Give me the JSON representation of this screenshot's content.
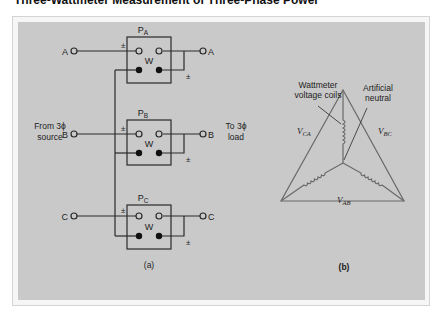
{
  "title": "Three-Wattmeter Measurement of Three-Phase Power",
  "panel_a": {
    "caption": "(a)",
    "source_label_line1": "From 3ϕ",
    "source_label_line2": "source",
    "load_label_line1": "To 3ϕ",
    "load_label_line2": "load",
    "wattmeters": [
      {
        "name": "P",
        "sub": "A",
        "phase": "A",
        "meter": "W",
        "pm": "±"
      },
      {
        "name": "P",
        "sub": "B",
        "phase": "B",
        "meter": "W",
        "pm": "±"
      },
      {
        "name": "P",
        "sub": "C",
        "phase": "C",
        "meter": "W",
        "pm": "±"
      }
    ]
  },
  "panel_b": {
    "caption": "(b)",
    "coils_label_line1": "Wattmeter",
    "coils_label_line2": "voltage coils",
    "neutral_label_line1": "Artificial",
    "neutral_label_line2": "neutral",
    "v_ca": {
      "main": "V",
      "sub": "CA"
    },
    "v_bc": {
      "main": "V",
      "sub": "BC"
    },
    "v_ab": {
      "main": "V",
      "sub": "AB"
    }
  },
  "colors": {
    "panel_bg": "#c9c9c9",
    "line": "#2a2a2a",
    "triangle": "#6a6a6a"
  }
}
